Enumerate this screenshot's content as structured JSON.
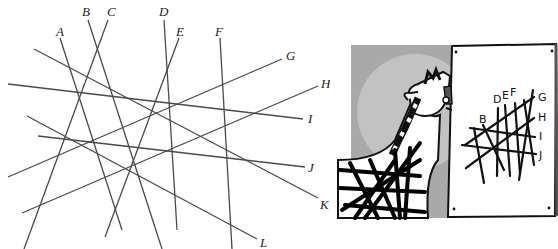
{
  "figure": {
    "puzzle": {
      "description": "Twelve labeled straight line segments crossing each other",
      "lines": [
        {
          "label": "A",
          "x1": 60,
          "y1": 38,
          "x2": 122,
          "y2": 230,
          "lx": 56,
          "ly": 36
        },
        {
          "label": "B",
          "x1": 88,
          "y1": 20,
          "x2": 162,
          "y2": 249,
          "lx": 82,
          "ly": 16
        },
        {
          "label": "C",
          "x1": 108,
          "y1": 20,
          "x2": 24,
          "y2": 249,
          "lx": 107,
          "ly": 16
        },
        {
          "label": "D",
          "x1": 164,
          "y1": 20,
          "x2": 177,
          "y2": 230,
          "lx": 159,
          "ly": 16
        },
        {
          "label": "E",
          "x1": 179,
          "y1": 38,
          "x2": 105,
          "y2": 237,
          "lx": 176,
          "ly": 36
        },
        {
          "label": "F",
          "x1": 220,
          "y1": 38,
          "x2": 232,
          "y2": 249,
          "lx": 215,
          "ly": 36
        },
        {
          "label": "G",
          "x1": 282,
          "y1": 59,
          "x2": 8,
          "y2": 177,
          "lx": 286,
          "ly": 60
        },
        {
          "label": "H",
          "x1": 318,
          "y1": 86,
          "x2": 22,
          "y2": 213,
          "lx": 321,
          "ly": 88
        },
        {
          "label": "I",
          "x1": 8,
          "y1": 84,
          "x2": 303,
          "y2": 119,
          "lx": 308,
          "ly": 123
        },
        {
          "label": "J",
          "x1": 38,
          "y1": 136,
          "x2": 305,
          "y2": 167,
          "lx": 308,
          "ly": 172
        },
        {
          "label": "K",
          "x1": 34,
          "y1": 49,
          "x2": 318,
          "y2": 198,
          "lx": 320,
          "ly": 209
        },
        {
          "label": "L",
          "x1": 27,
          "y1": 116,
          "x2": 257,
          "y2": 239,
          "lx": 260,
          "ly": 247
        }
      ]
    },
    "cartoon": {
      "description": "Cartoon zebra with tangled stripes looking at a poster of crossing lines",
      "poster_labels": [
        "B",
        "D",
        "E",
        "F",
        "G",
        "H",
        "I",
        "J"
      ],
      "colors": {
        "background_gray": "#a9a9a9",
        "light_circle": "#c4c4c4",
        "poster": "#ffffff",
        "ink": "#111111"
      }
    }
  }
}
